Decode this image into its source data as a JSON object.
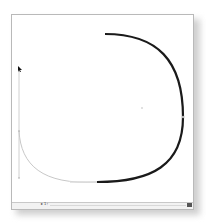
{
  "window": {
    "type": "vector-drawing-canvas"
  },
  "canvas": {
    "tool": "pen-tool",
    "path": {
      "stroke_color": "#1a1a1a",
      "guide_color": "#bdbdbd",
      "anchor_points": [
        {
          "x": 93,
          "y": 19
        },
        {
          "x": 171,
          "y": 102
        },
        {
          "x": 85,
          "y": 167
        }
      ],
      "center_point": {
        "x": 130,
        "y": 93
      }
    }
  },
  "statusbar": {
    "zoom_label": "▸ 1↑",
    "scroll_button_icon": "scroll-right-icon"
  }
}
